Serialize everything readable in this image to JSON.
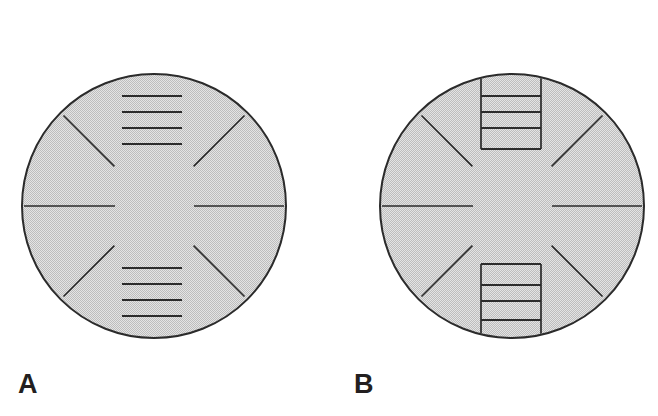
{
  "figure": {
    "background_color": "#ffffff",
    "disc_fill_color": "#d2d2d2",
    "disc_stroke_color": "#2b2b2b",
    "mark_color": "#2b2b2b",
    "label_color": "#231f20",
    "panels": [
      {
        "id": "A",
        "label": "A",
        "disc": {
          "center_x": 154,
          "center_y": 206,
          "radius": 132,
          "stroke_width": 2
        },
        "diagonal_spokes": [
          {
            "name": "upper-left",
            "angle_deg": 225,
            "inner_radius": 56,
            "outer_radius": 128
          },
          {
            "name": "upper-right",
            "angle_deg": 315,
            "inner_radius": 56,
            "outer_radius": 128
          },
          {
            "name": "lower-left",
            "angle_deg": 135,
            "inner_radius": 56,
            "outer_radius": 128
          },
          {
            "name": "lower-right",
            "angle_deg": 45,
            "inner_radius": 56,
            "outer_radius": 128
          }
        ],
        "horizontal_radials": [
          {
            "name": "left-radial",
            "y": 206,
            "x_start": 24,
            "x_end": 115
          },
          {
            "name": "right-radial",
            "y": 206,
            "x_start": 194,
            "x_end": 284
          }
        ],
        "top_rungs": {
          "count": 4,
          "x_start": 122,
          "x_end": 182,
          "y_values": [
            96,
            112,
            128,
            144
          ]
        },
        "bottom_rungs": {
          "count": 4,
          "x_start": 122,
          "x_end": 182,
          "y_values": [
            268,
            284,
            300,
            316
          ]
        },
        "rails": {
          "present": false,
          "count": 0
        }
      },
      {
        "id": "B",
        "label": "B",
        "disc": {
          "center_x": 183,
          "center_y": 206,
          "radius": 132,
          "stroke_width": 2
        },
        "diagonal_spokes": [
          {
            "name": "upper-left",
            "angle_deg": 225,
            "inner_radius": 56,
            "outer_radius": 128
          },
          {
            "name": "upper-right",
            "angle_deg": 315,
            "inner_radius": 56,
            "outer_radius": 128
          },
          {
            "name": "lower-left",
            "angle_deg": 135,
            "inner_radius": 56,
            "outer_radius": 128
          },
          {
            "name": "lower-right",
            "angle_deg": 45,
            "inner_radius": 56,
            "outer_radius": 128
          }
        ],
        "horizontal_radials": [
          {
            "name": "left-radial",
            "y": 206,
            "x_start": 53,
            "x_end": 144
          },
          {
            "name": "right-radial",
            "y": 206,
            "x_start": 223,
            "x_end": 313
          }
        ],
        "top_ladder": {
          "rung_count": 4,
          "x_start": 152,
          "x_end": 212,
          "y_values": [
            96,
            112,
            128,
            149
          ],
          "rail_top_y": 76,
          "rail_bottom_y": 149
        },
        "bottom_ladder": {
          "rung_count": 4,
          "x_start": 152,
          "x_end": 212,
          "y_values": [
            264,
            285,
            301,
            320
          ],
          "rail_top_y": 264,
          "rail_bottom_y": 338
        },
        "rails": {
          "present": true,
          "count": 2,
          "x_positions": [
            152,
            212
          ]
        }
      }
    ]
  }
}
